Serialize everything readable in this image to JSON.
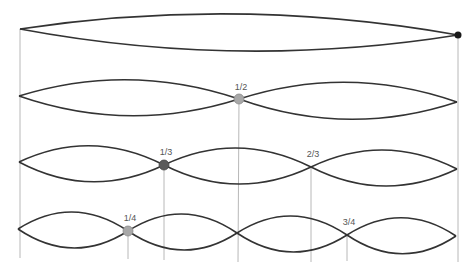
{
  "diagram": {
    "colors": {
      "wave": "#333333",
      "guide": "#b8b8b8",
      "node_end": "#1a1a1a",
      "node_half": "#a8a8a8",
      "node_third": "#5a5a5a",
      "node_quarter": "#a8a8a8"
    },
    "rows": [
      {
        "harmonic": 1,
        "segments": 1,
        "labels": []
      },
      {
        "harmonic": 2,
        "segments": 2,
        "labels": [
          "1/2"
        ]
      },
      {
        "harmonic": 3,
        "segments": 3,
        "labels": [
          "1/3",
          "2/3"
        ]
      },
      {
        "harmonic": 4,
        "segments": 4,
        "labels": [
          "1/4",
          "3/4"
        ]
      }
    ],
    "labels": {
      "half": "1/2",
      "third": "1/3",
      "two_thirds": "2/3",
      "quarter": "1/4",
      "three_quarters": "3/4"
    }
  }
}
